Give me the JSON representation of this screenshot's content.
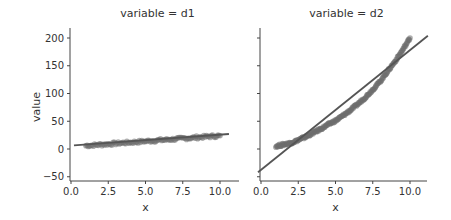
{
  "chart_data": {
    "type": "scatter",
    "layout": "facet-grid (seaborn lmplot, col=variable)",
    "shared_y": true,
    "ylabel": "value",
    "ylim": [
      -55,
      215
    ],
    "yticks": [
      -50,
      0,
      50,
      100,
      150,
      200
    ],
    "ytick_labels": [
      "−50",
      "0",
      "50",
      "100",
      "150",
      "200"
    ],
    "grid": false,
    "legend": null,
    "colors": {
      "points": "#6e6e6e",
      "line": "#555555",
      "axis": "#444444",
      "text": "#333333"
    },
    "panels": [
      {
        "title": "variable = d1",
        "xlabel": "x",
        "xlim": [
          -0.2,
          11.2
        ],
        "xticks": [
          0.0,
          2.5,
          5.0,
          7.5,
          10.0
        ],
        "xtick_labels": [
          "0.0",
          "2.5",
          "5.0",
          "7.5",
          "10.0"
        ],
        "scatter": {
          "x": [
            1.0,
            2.0,
            3.0,
            4.0,
            5.0,
            6.0,
            7.0,
            8.0,
            9.0,
            10.0
          ],
          "y": [
            6,
            8,
            10,
            12,
            14,
            16,
            18,
            20,
            22,
            24
          ]
        },
        "regression_line": {
          "x": [
            0.2,
            10.6
          ],
          "y": [
            6.5,
            27
          ]
        }
      },
      {
        "title": "variable = d2",
        "xlabel": "x",
        "xlim": [
          -0.2,
          11.2
        ],
        "xticks": [
          0.0,
          2.5,
          5.0,
          7.5,
          10.0
        ],
        "xtick_labels": [
          "0.0",
          "2.5",
          "5.0",
          "7.5",
          "10.0"
        ],
        "scatter": {
          "x": [
            1.0,
            1.5,
            2.0,
            2.5,
            3.0,
            3.5,
            4.0,
            4.5,
            5.0,
            5.5,
            6.0,
            6.5,
            7.0,
            7.5,
            8.0,
            8.5,
            9.0,
            9.5,
            10.0
          ],
          "y": [
            5,
            8,
            11,
            16,
            22,
            29,
            36,
            44,
            51,
            60,
            70,
            81,
            93,
            107,
            122,
            140,
            158,
            178,
            200
          ]
        },
        "regression_line": {
          "x": [
            -0.2,
            11.2
          ],
          "y": [
            -42,
            204
          ]
        }
      }
    ]
  }
}
